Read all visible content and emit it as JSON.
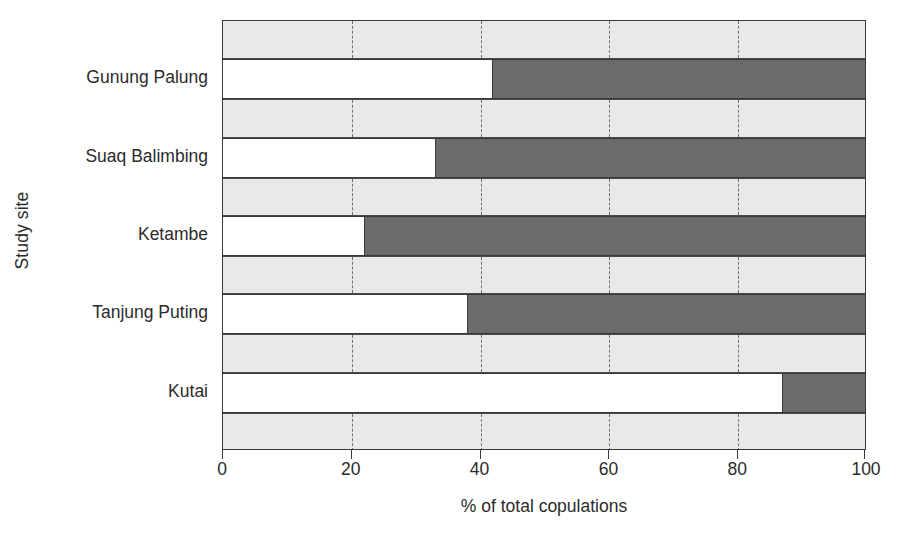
{
  "chart_data": {
    "type": "bar",
    "orientation": "horizontal",
    "stacked": true,
    "title": "",
    "xlabel": "% of total copulations",
    "ylabel": "Study site",
    "xlim": [
      0,
      100
    ],
    "xticks": [
      0,
      20,
      40,
      60,
      80,
      100
    ],
    "xtick_labels": [
      "0",
      "20",
      "40",
      "60",
      "80",
      "100"
    ],
    "grid": "vertical-dashed",
    "legend": "none",
    "categories": [
      "Gunung Palung",
      "Suaq Balimbing",
      "Ketambe",
      "Tanjung Puting",
      "Kutai"
    ],
    "series": [
      {
        "name": "light-segment",
        "color": "#ffffff",
        "values": [
          42,
          33,
          22,
          38,
          87
        ]
      },
      {
        "name": "dark-segment",
        "color": "#6b6b6b",
        "values": [
          58,
          67,
          78,
          62,
          13
        ]
      }
    ],
    "colors": {
      "light_fill": "#ffffff",
      "dark_fill": "#6b6b6b",
      "band_fill": "#e9e9e9",
      "axis_line": "#3a3a3a",
      "gridline": "#707070",
      "text": "#2b2b2b"
    }
  }
}
